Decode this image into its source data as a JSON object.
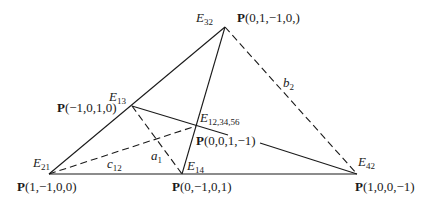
{
  "diagram": {
    "type": "geometric-figure",
    "vertices": [
      {
        "id": "E32",
        "name": "E",
        "sub": "32",
        "point_label": "(0,1,−1,0,)"
      },
      {
        "id": "E13",
        "name": "E",
        "sub": "13",
        "point_label": "(−1,0,1,0)"
      },
      {
        "id": "E12_34_56",
        "name": "E",
        "sub": "12,34,56",
        "point_label": "(0,0,1,−1)"
      },
      {
        "id": "E21",
        "name": "E",
        "sub": "21",
        "point_label": "(1,−1,0,0)"
      },
      {
        "id": "E14",
        "name": "E",
        "sub": "14",
        "point_label": "(0,−1,0,1)"
      },
      {
        "id": "E42",
        "name": "E",
        "sub": "42",
        "point_label": "(1,0,0,−1)"
      }
    ],
    "point_prefix": "P",
    "edges": [
      {
        "from": "E21",
        "to": "E32",
        "style": "solid"
      },
      {
        "from": "E21",
        "to": "E42",
        "style": "solid"
      },
      {
        "from": "E32",
        "to": "E14",
        "style": "solid"
      },
      {
        "from": "E13",
        "to": "E42",
        "style": "solid",
        "via": "E12_34_56"
      },
      {
        "from": "E32",
        "to": "E42",
        "style": "dashed",
        "label": "b",
        "label_sub": "2"
      },
      {
        "from": "E21",
        "to": "E12_34_56",
        "style": "dashed",
        "label": "c",
        "label_sub": "12"
      },
      {
        "from": "E13",
        "to": "E14",
        "style": "dashed",
        "label": "a",
        "label_sub": "1"
      }
    ]
  }
}
